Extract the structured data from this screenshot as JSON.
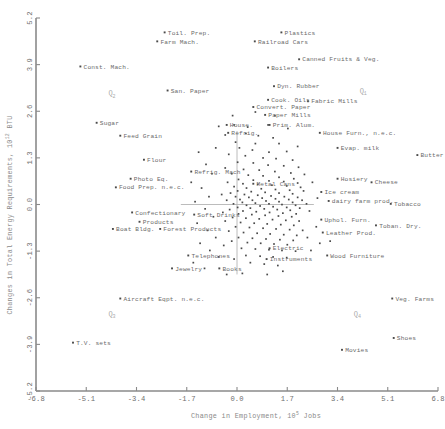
{
  "chart_data": {
    "type": "scatter",
    "title": "",
    "xlabel": "Change in Employment, 10",
    "xlabel_exp": "5",
    "xlabel_tail": " Jobs",
    "ylabel": "Changes in Total Energy Requirements, 10",
    "ylabel_exp": "12",
    "ylabel_tail": " BTU",
    "xlim": [
      -6.8,
      6.8
    ],
    "ylim": [
      -5.2,
      5.2
    ],
    "xticks": [
      "-6.8",
      "-5.1",
      "-3.4",
      "-1.7",
      "0.0",
      "1.7",
      "3.4",
      "5.1",
      "6.8"
    ],
    "xtick_values": [
      -6.8,
      -5.1,
      -3.4,
      -1.7,
      0.0,
      1.7,
      3.4,
      5.1,
      6.8
    ],
    "yticks": [
      "5.2",
      "3.9",
      "2.6",
      "1.3",
      "0.0",
      "-1.3",
      "-2.6",
      "-3.9",
      "-5.2"
    ],
    "ytick_values": [
      5.2,
      3.9,
      2.6,
      1.3,
      0.0,
      -1.3,
      -2.6,
      -3.9,
      -5.2
    ],
    "grid": false,
    "legend": "none",
    "quadrant_markers": [
      {
        "label": "Q",
        "sub": "2",
        "x": -4.35,
        "y": 3.05
      },
      {
        "label": "Q",
        "sub": "1",
        "x": 4.15,
        "y": 3.12
      },
      {
        "label": "Q",
        "sub": "3",
        "x": -4.35,
        "y": -3.1
      },
      {
        "label": "Q",
        "sub": "4",
        "x": 3.95,
        "y": -3.1
      }
    ],
    "labeled_points": [
      {
        "label": "Toil. Prep.",
        "x": -2.45,
        "y": 4.8,
        "anchor": "left"
      },
      {
        "label": "Farm Mach.",
        "x": -2.7,
        "y": 4.55,
        "anchor": "left"
      },
      {
        "label": "Plastics",
        "x": 1.5,
        "y": 4.8,
        "anchor": "left"
      },
      {
        "label": "Railroad Cars",
        "x": 0.6,
        "y": 4.55,
        "anchor": "left"
      },
      {
        "label": "Const. Mach.",
        "x": -5.3,
        "y": 3.85,
        "anchor": "left"
      },
      {
        "label": "Boilers",
        "x": 1.05,
        "y": 3.82,
        "anchor": "left"
      },
      {
        "label": "Canned Fruits & Veg.",
        "x": 2.1,
        "y": 4.05,
        "anchor": "left"
      },
      {
        "label": "Dyn. Rubber",
        "x": 1.25,
        "y": 3.3,
        "anchor": "left"
      },
      {
        "label": "San. Paper",
        "x": -2.35,
        "y": 3.18,
        "anchor": "left"
      },
      {
        "label": "Cook. Oils",
        "x": 1.05,
        "y": 2.92,
        "anchor": "left"
      },
      {
        "label": "Convert. Paper",
        "x": 0.55,
        "y": 2.72,
        "anchor": "left"
      },
      {
        "label": "Fabric Mills",
        "x": 2.4,
        "y": 2.88,
        "anchor": "left"
      },
      {
        "label": "Paper Mills",
        "x": 0.95,
        "y": 2.5,
        "anchor": "left"
      },
      {
        "label": "Sugar",
        "x": -4.75,
        "y": 2.28,
        "anchor": "left"
      },
      {
        "label": "House.",
        "x": -0.35,
        "y": 2.22,
        "anchor": "left"
      },
      {
        "label": "Prim. Alum.",
        "x": 1.1,
        "y": 2.22,
        "anchor": "left"
      },
      {
        "label": "Refrig.",
        "x": -0.3,
        "y": 2.0,
        "anchor": "left"
      },
      {
        "label": "House Furn., n.e.c.",
        "x": 2.8,
        "y": 2.0,
        "anchor": "left"
      },
      {
        "label": "Feed Grain",
        "x": -3.95,
        "y": 1.92,
        "anchor": "left"
      },
      {
        "label": "Evap. milk",
        "x": 3.4,
        "y": 1.58,
        "anchor": "left"
      },
      {
        "label": "Butter",
        "x": 6.1,
        "y": 1.38,
        "anchor": "left"
      },
      {
        "label": "Flour",
        "x": -3.15,
        "y": 1.25,
        "anchor": "left"
      },
      {
        "label": "Refrig. Mach",
        "x": -1.55,
        "y": 0.92,
        "anchor": "left"
      },
      {
        "label": "Photo Eq.",
        "x": -3.6,
        "y": 0.72,
        "anchor": "left"
      },
      {
        "label": "Hosiery",
        "x": 3.4,
        "y": 0.72,
        "anchor": "left"
      },
      {
        "label": "Cheese",
        "x": 4.55,
        "y": 0.62,
        "anchor": "left"
      },
      {
        "label": "Metal Cans",
        "x": 0.55,
        "y": 0.58,
        "anchor": "left"
      },
      {
        "label": "Food Prep. n.e.c.",
        "x": -4.1,
        "y": 0.48,
        "anchor": "left"
      },
      {
        "label": "Ice cream",
        "x": 2.85,
        "y": 0.35,
        "anchor": "left"
      },
      {
        "label": "dairy farm prod.",
        "x": 3.1,
        "y": 0.1,
        "anchor": "left"
      },
      {
        "label": "Tobacco",
        "x": 5.2,
        "y": 0.02,
        "anchor": "left"
      },
      {
        "label": "Confectionary",
        "x": -3.55,
        "y": -0.22,
        "anchor": "left"
      },
      {
        "label": "Soft Drinks",
        "x": -1.45,
        "y": -0.28,
        "anchor": "left"
      },
      {
        "label": "Products",
        "x": -3.3,
        "y": -0.48,
        "anchor": "left"
      },
      {
        "label": "Uphol. Furn.",
        "x": 2.85,
        "y": -0.42,
        "anchor": "left"
      },
      {
        "label": "Toban. Dry.",
        "x": 4.7,
        "y": -0.58,
        "anchor": "left"
      },
      {
        "label": "Boat Bldg.",
        "x": -4.2,
        "y": -0.68,
        "anchor": "left"
      },
      {
        "label": "Forest Products",
        "x": -2.6,
        "y": -0.68,
        "anchor": "left"
      },
      {
        "label": "Leather Prod.",
        "x": 2.9,
        "y": -0.78,
        "anchor": "left"
      },
      {
        "label": "Electric",
        "x": 1.1,
        "y": -1.22,
        "anchor": "left"
      },
      {
        "label": "Telephones",
        "x": -1.65,
        "y": -1.42,
        "anchor": "left"
      },
      {
        "label": "Instruments",
        "x": 1.0,
        "y": -1.52,
        "anchor": "left"
      },
      {
        "label": "Wood Furniture",
        "x": 3.05,
        "y": -1.42,
        "anchor": "left"
      },
      {
        "label": "Jewelry",
        "x": -2.2,
        "y": -1.78,
        "anchor": "left"
      },
      {
        "label": "Books",
        "x": -0.6,
        "y": -1.78,
        "anchor": "left"
      },
      {
        "label": "Aircraft Eqpt. n.e.c.",
        "x": -3.95,
        "y": -2.62,
        "anchor": "left"
      },
      {
        "label": "Veg. Farms",
        "x": 5.25,
        "y": -2.62,
        "anchor": "left"
      },
      {
        "label": "Shoes",
        "x": 5.3,
        "y": -3.72,
        "anchor": "left"
      },
      {
        "label": "T.V. sets",
        "x": -5.55,
        "y": -3.85,
        "anchor": "left"
      },
      {
        "label": "Movies",
        "x": 3.55,
        "y": -4.05,
        "anchor": "left"
      }
    ],
    "cluster_points": [
      [
        -0.62,
        2.18
      ],
      [
        -0.1,
        2.22
      ],
      [
        0.36,
        2.16
      ],
      [
        1.05,
        2.22
      ],
      [
        0.3,
        1.98
      ],
      [
        -0.4,
        1.94
      ],
      [
        0.72,
        1.92
      ],
      [
        1.22,
        1.86
      ],
      [
        -0.05,
        1.74
      ],
      [
        0.62,
        1.7
      ],
      [
        1.42,
        1.7
      ],
      [
        0.08,
        1.58
      ],
      [
        0.52,
        1.52
      ],
      [
        1.08,
        1.46
      ],
      [
        1.68,
        1.48
      ],
      [
        -0.28,
        1.4
      ],
      [
        0.28,
        1.36
      ],
      [
        0.88,
        1.3
      ],
      [
        1.32,
        1.28
      ],
      [
        1.88,
        1.24
      ],
      [
        0.02,
        1.18
      ],
      [
        0.55,
        1.16
      ],
      [
        1.05,
        1.1
      ],
      [
        1.58,
        1.08
      ],
      [
        2.08,
        1.04
      ],
      [
        -0.4,
        1.02
      ],
      [
        0.22,
        0.98
      ],
      [
        0.75,
        0.96
      ],
      [
        1.28,
        0.92
      ],
      [
        1.82,
        0.88
      ],
      [
        2.28,
        0.84
      ],
      [
        -0.18,
        0.86
      ],
      [
        0.38,
        0.82
      ],
      [
        0.88,
        0.8
      ],
      [
        1.42,
        0.76
      ],
      [
        1.92,
        0.72
      ],
      [
        0.05,
        0.7
      ],
      [
        0.55,
        0.68
      ],
      [
        1.08,
        0.66
      ],
      [
        1.58,
        0.64
      ],
      [
        2.05,
        0.6
      ],
      [
        -0.32,
        0.62
      ],
      [
        0.2,
        0.58
      ],
      [
        0.7,
        0.56
      ],
      [
        1.18,
        0.54
      ],
      [
        1.68,
        0.52
      ],
      [
        2.15,
        0.48
      ],
      [
        -0.1,
        0.5
      ],
      [
        0.32,
        0.46
      ],
      [
        0.82,
        0.44
      ],
      [
        1.3,
        0.42
      ],
      [
        1.78,
        0.4
      ],
      [
        2.25,
        0.38
      ],
      [
        0.02,
        0.38
      ],
      [
        0.48,
        0.36
      ],
      [
        0.95,
        0.34
      ],
      [
        1.42,
        0.32
      ],
      [
        1.88,
        0.3
      ],
      [
        -0.22,
        0.32
      ],
      [
        0.25,
        0.28
      ],
      [
        0.7,
        0.26
      ],
      [
        1.15,
        0.24
      ],
      [
        1.6,
        0.22
      ],
      [
        2.05,
        0.2
      ],
      [
        -0.05,
        0.22
      ],
      [
        0.4,
        0.2
      ],
      [
        0.85,
        0.18
      ],
      [
        1.3,
        0.16
      ],
      [
        1.75,
        0.14
      ],
      [
        2.2,
        0.12
      ],
      [
        0.1,
        0.14
      ],
      [
        0.52,
        0.12
      ],
      [
        0.98,
        0.1
      ],
      [
        1.42,
        0.08
      ],
      [
        1.88,
        0.06
      ],
      [
        -0.35,
        0.12
      ],
      [
        0.18,
        0.06
      ],
      [
        0.62,
        0.04
      ],
      [
        1.08,
        0.02
      ],
      [
        1.52,
        0.0
      ],
      [
        1.98,
        -0.02
      ],
      [
        -0.12,
        0.02
      ],
      [
        0.32,
        -0.02
      ],
      [
        0.78,
        -0.04
      ],
      [
        1.22,
        -0.06
      ],
      [
        1.68,
        -0.08
      ],
      [
        2.12,
        -0.1
      ],
      [
        0.02,
        -0.08
      ],
      [
        0.45,
        -0.1
      ],
      [
        0.92,
        -0.12
      ],
      [
        1.36,
        -0.14
      ],
      [
        1.8,
        -0.16
      ],
      [
        -0.25,
        -0.14
      ],
      [
        0.2,
        -0.18
      ],
      [
        0.65,
        -0.2
      ],
      [
        1.1,
        -0.22
      ],
      [
        1.55,
        -0.24
      ],
      [
        2.0,
        -0.26
      ],
      [
        -0.48,
        -0.22
      ],
      [
        0.05,
        -0.26
      ],
      [
        0.5,
        -0.28
      ],
      [
        0.95,
        -0.3
      ],
      [
        1.4,
        -0.32
      ],
      [
        1.85,
        -0.34
      ],
      [
        -0.15,
        -0.36
      ],
      [
        0.3,
        -0.38
      ],
      [
        0.75,
        -0.4
      ],
      [
        1.2,
        -0.42
      ],
      [
        1.65,
        -0.44
      ],
      [
        2.1,
        -0.46
      ],
      [
        -0.4,
        -0.46
      ],
      [
        0.12,
        -0.5
      ],
      [
        0.58,
        -0.52
      ],
      [
        1.02,
        -0.54
      ],
      [
        1.48,
        -0.56
      ],
      [
        1.92,
        -0.58
      ],
      [
        -0.05,
        -0.62
      ],
      [
        0.42,
        -0.64
      ],
      [
        0.88,
        -0.66
      ],
      [
        1.32,
        -0.68
      ],
      [
        1.78,
        -0.7
      ],
      [
        2.22,
        -0.72
      ],
      [
        -0.28,
        -0.74
      ],
      [
        0.22,
        -0.78
      ],
      [
        0.68,
        -0.8
      ],
      [
        1.12,
        -0.82
      ],
      [
        1.58,
        -0.84
      ],
      [
        2.02,
        -0.86
      ],
      [
        0.05,
        -0.92
      ],
      [
        0.52,
        -0.94
      ],
      [
        0.98,
        -0.96
      ],
      [
        1.45,
        -0.98
      ],
      [
        1.9,
        -1.0
      ],
      [
        -0.18,
        -1.02
      ],
      [
        0.35,
        -1.06
      ],
      [
        0.8,
        -1.08
      ],
      [
        1.25,
        -1.1
      ],
      [
        1.7,
        -1.12
      ],
      [
        -0.45,
        -1.14
      ],
      [
        0.15,
        -1.22
      ],
      [
        0.62,
        -1.24
      ],
      [
        1.08,
        -1.26
      ],
      [
        1.52,
        -1.28
      ],
      [
        1.98,
        -1.3
      ],
      [
        0.3,
        -1.42
      ],
      [
        0.78,
        -1.44
      ],
      [
        1.22,
        -1.46
      ],
      [
        1.68,
        -1.48
      ],
      [
        -0.1,
        -1.52
      ],
      [
        0.45,
        -1.62
      ],
      [
        0.92,
        -1.66
      ],
      [
        1.38,
        -1.7
      ],
      [
        -1.3,
        1.46
      ],
      [
        -1.05,
        1.12
      ],
      [
        -0.85,
        0.86
      ],
      [
        -1.55,
        0.62
      ],
      [
        -1.2,
        0.46
      ],
      [
        -0.95,
        0.22
      ],
      [
        -1.42,
        0.08
      ],
      [
        -1.08,
        -0.12
      ],
      [
        -0.8,
        -0.34
      ],
      [
        -1.35,
        -0.52
      ],
      [
        -1.0,
        -0.72
      ],
      [
        -0.72,
        -0.92
      ],
      [
        -1.25,
        -1.08
      ],
      [
        -0.92,
        -1.28
      ],
      [
        -0.62,
        -1.46
      ],
      [
        -1.48,
        -1.62
      ],
      [
        -1.1,
        -1.78
      ],
      [
        2.55,
        0.62
      ],
      [
        2.72,
        0.18
      ],
      [
        2.45,
        -0.18
      ],
      [
        2.68,
        -0.62
      ],
      [
        2.38,
        -0.92
      ],
      [
        2.8,
        -1.08
      ],
      [
        2.5,
        -1.28
      ],
      [
        0.62,
        2.58
      ],
      [
        1.28,
        2.48
      ],
      [
        -0.15,
        2.48
      ],
      [
        1.72,
        2.12
      ],
      [
        2.05,
        1.62
      ],
      [
        -0.72,
        1.58
      ],
      [
        -0.52,
        0.28
      ],
      [
        3.15,
        -1.02
      ],
      [
        0.18,
        -1.92
      ],
      [
        1.02,
        -1.95
      ],
      [
        -0.35,
        -1.95
      ],
      [
        2.35,
        0.02
      ],
      [
        1.55,
        -1.86
      ]
    ],
    "point_count_note": ""
  }
}
